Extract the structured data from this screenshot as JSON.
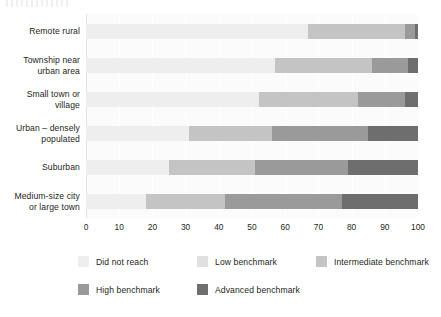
{
  "chart_data": {
    "type": "bar",
    "orientation": "horizontal",
    "stacked": true,
    "title": "",
    "subtitle": "",
    "xlabel": "",
    "ylabel": "",
    "xlim": [
      0,
      100
    ],
    "xticks": [
      0,
      10,
      20,
      30,
      40,
      50,
      60,
      70,
      80,
      90,
      100
    ],
    "xtick_labels": [
      "0",
      "10",
      "20",
      "30",
      "40",
      "50",
      "60",
      "70",
      "80",
      "90",
      "100"
    ],
    "grid": true,
    "grid_axis": "x",
    "legend_position": "bottom",
    "categories": [
      "Remote rural",
      "Township near urban area",
      "Small town or village",
      "Urban – densely populated",
      "Suburban",
      "Medium-size city or large town"
    ],
    "category_lines": [
      [
        "Remote rural"
      ],
      [
        "Township near",
        "urban area"
      ],
      [
        "Small town or",
        "village"
      ],
      [
        "Urban – densely",
        "populated"
      ],
      [
        "Suburban"
      ],
      [
        "Medium-size city",
        "or large town"
      ]
    ],
    "series": [
      {
        "name": "Did not reach",
        "color": "#eeeeee",
        "values": [
          67,
          57,
          52,
          31,
          25,
          18
        ]
      },
      {
        "name": "Low benchmark",
        "color": "#e0e0e0",
        "values": [
          0,
          0,
          0,
          0,
          0,
          0
        ]
      },
      {
        "name": "Intermediate benchmark",
        "color": "#c4c4c4",
        "values": [
          29,
          29,
          30,
          25,
          26,
          24
        ]
      },
      {
        "name": "High benchmark",
        "color": "#9a9a9a",
        "values": [
          3,
          11,
          14,
          29,
          28,
          35
        ]
      },
      {
        "name": "Advanced benchmark",
        "color": "#6e6e6e",
        "values": [
          1,
          3,
          4,
          15,
          21,
          23
        ]
      }
    ],
    "legend_entries": [
      {
        "label": "Did not reach",
        "color": "#eeeeee"
      },
      {
        "label": "Low benchmark",
        "color": "#e0e0e0"
      },
      {
        "label": "Intermediate benchmark",
        "color": "#c4c4c4"
      },
      {
        "label": "High benchmark",
        "color": "#9a9a9a"
      },
      {
        "label": "Advanced benchmark",
        "color": "#6e6e6e"
      }
    ],
    "bars": [
      {
        "category": "Remote rural",
        "segments": [
          {
            "series": "Did not reach",
            "value": 67,
            "start": 0,
            "end": 67
          },
          {
            "series": "Low benchmark",
            "value": 0,
            "start": 67,
            "end": 67
          },
          {
            "series": "Intermediate benchmark",
            "value": 29,
            "start": 67,
            "end": 96
          },
          {
            "series": "High benchmark",
            "value": 3,
            "start": 96,
            "end": 99
          },
          {
            "series": "Advanced benchmark",
            "value": 1,
            "start": 99,
            "end": 100
          }
        ]
      },
      {
        "category": "Township near urban area",
        "segments": [
          {
            "series": "Did not reach",
            "value": 57,
            "start": 0,
            "end": 57
          },
          {
            "series": "Low benchmark",
            "value": 0,
            "start": 57,
            "end": 57
          },
          {
            "series": "Intermediate benchmark",
            "value": 29,
            "start": 57,
            "end": 86
          },
          {
            "series": "High benchmark",
            "value": 11,
            "start": 86,
            "end": 97
          },
          {
            "series": "Advanced benchmark",
            "value": 3,
            "start": 97,
            "end": 100
          }
        ]
      },
      {
        "category": "Small town or village",
        "segments": [
          {
            "series": "Did not reach",
            "value": 52,
            "start": 0,
            "end": 52
          },
          {
            "series": "Low benchmark",
            "value": 0,
            "start": 52,
            "end": 52
          },
          {
            "series": "Intermediate benchmark",
            "value": 30,
            "start": 52,
            "end": 82
          },
          {
            "series": "High benchmark",
            "value": 14,
            "start": 82,
            "end": 96
          },
          {
            "series": "Advanced benchmark",
            "value": 4,
            "start": 96,
            "end": 100
          }
        ]
      },
      {
        "category": "Urban – densely populated",
        "segments": [
          {
            "series": "Did not reach",
            "value": 31,
            "start": 0,
            "end": 31
          },
          {
            "series": "Low benchmark",
            "value": 0,
            "start": 31,
            "end": 31
          },
          {
            "series": "Intermediate benchmark",
            "value": 25,
            "start": 31,
            "end": 56
          },
          {
            "series": "High benchmark",
            "value": 29,
            "start": 56,
            "end": 85
          },
          {
            "series": "Advanced benchmark",
            "value": 15,
            "start": 85,
            "end": 100
          }
        ]
      },
      {
        "category": "Suburban",
        "segments": [
          {
            "series": "Did not reach",
            "value": 25,
            "start": 0,
            "end": 25
          },
          {
            "series": "Low benchmark",
            "value": 0,
            "start": 25,
            "end": 25
          },
          {
            "series": "Intermediate benchmark",
            "value": 26,
            "start": 25,
            "end": 51
          },
          {
            "series": "High benchmark",
            "value": 28,
            "start": 51,
            "end": 79
          },
          {
            "series": "Advanced benchmark",
            "value": 21,
            "start": 79,
            "end": 100
          }
        ]
      },
      {
        "category": "Medium-size city or large town",
        "segments": [
          {
            "series": "Did not reach",
            "value": 18,
            "start": 0,
            "end": 18
          },
          {
            "series": "Low benchmark",
            "value": 0,
            "start": 18,
            "end": 18
          },
          {
            "series": "Intermediate benchmark",
            "value": 24,
            "start": 18,
            "end": 42
          },
          {
            "series": "High benchmark",
            "value": 35,
            "start": 42,
            "end": 77
          },
          {
            "series": "Advanced benchmark",
            "value": 23,
            "start": 77,
            "end": 100
          }
        ]
      }
    ]
  },
  "colors": {
    "did_not_reach": "#eeeeee",
    "low_benchmark": "#e0e0e0",
    "intermediate_benchmark": "#c4c4c4",
    "high_benchmark": "#9a9a9a",
    "advanced_benchmark": "#6e6e6e",
    "plot_background": "#fbfbfb",
    "gridline": "#ffffff",
    "text": "#231f20",
    "page_background": "#ffffff"
  }
}
